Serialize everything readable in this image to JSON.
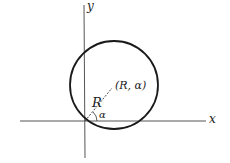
{
  "diagram": {
    "axes": {
      "x_label": "x",
      "y_label": "y"
    },
    "point_label": "(R, α)",
    "radius_label": "R",
    "angle_label": "α",
    "colors": {
      "stroke": "#1a1a1a",
      "axis": "#555555",
      "background": "#ffffff"
    }
  }
}
